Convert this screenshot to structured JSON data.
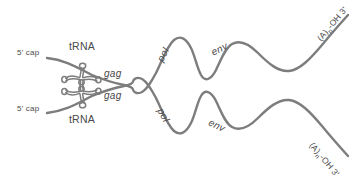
{
  "diagram": {
    "type": "biology-schematic",
    "stroke_color": "#7d7d7d",
    "label_color": "#4a4a4a",
    "background_color": "#ffffff",
    "width": 364,
    "height": 176
  },
  "labels": {
    "cap_top": "5' cap",
    "cap_bottom": "5' cap",
    "trna_top": "tRNA",
    "trna_bottom": "tRNA",
    "gag_top": "gag",
    "gag_bottom": "gag",
    "pol_top": "pol",
    "pol_bottom": "pol",
    "env_top": "env",
    "env_bottom": "env",
    "tail_top_pre": "(A)",
    "tail_top_sub": "n",
    "tail_top_post": "-OH 3'",
    "tail_bottom_pre": "(A)",
    "tail_bottom_sub": "n",
    "tail_bottom_post": "-OH 3'"
  },
  "strands": [
    {
      "name": "rna-strand-top",
      "five_prime_label": "5' cap",
      "three_prime_label": "(A)n-OH 3'",
      "genes": [
        "gag",
        "pol",
        "env"
      ],
      "primer": "tRNA"
    },
    {
      "name": "rna-strand-bottom",
      "five_prime_label": "5' cap",
      "three_prime_label": "(A)n-OH 3'",
      "genes": [
        "gag",
        "pol",
        "env"
      ],
      "primer": "tRNA"
    }
  ]
}
